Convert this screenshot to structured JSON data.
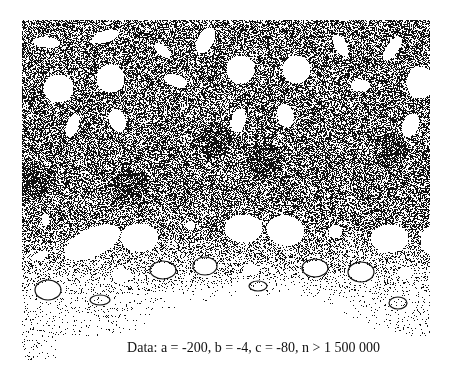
{
  "figure": {
    "type": "attractor-plot",
    "foreground_color": "#111111",
    "background_color": "#ffffff"
  },
  "caption": {
    "text": "Data: a = -200, b = -4, c = -80, n > 1 500 000",
    "parameters": {
      "a": -200,
      "b": -4,
      "c": -80,
      "n": "> 1 500 000"
    }
  }
}
